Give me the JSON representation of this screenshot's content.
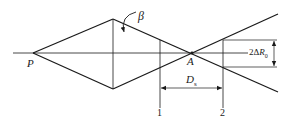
{
  "diagram": {
    "labels": {
      "P": "P",
      "A": "A",
      "beta": "β",
      "Ds_main": "D",
      "Ds_sub": "s",
      "dR_prefix": "2Δ",
      "dR_main": "R",
      "dR_sub": "0",
      "line1": "1",
      "line2": "2"
    },
    "colors": {
      "stroke": "#1a1a1a",
      "background": "#ffffff"
    }
  }
}
